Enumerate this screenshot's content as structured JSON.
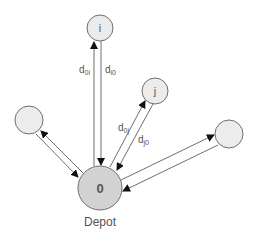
{
  "diagram": {
    "title": "",
    "colors": {
      "node_fill": "#ececec",
      "depot_fill": "#d2d2d2",
      "stroke": "#6e6e6e",
      "text": "#555555"
    },
    "nodes": [
      {
        "id": "depot",
        "label": "0",
        "caption": "Depot",
        "cx": 100,
        "cy": 188,
        "r": 22
      },
      {
        "id": "i",
        "label": "i",
        "cx": 100,
        "cy": 28,
        "r": 13
      },
      {
        "id": "j",
        "label": "j",
        "cx": 155,
        "cy": 91,
        "r": 13
      },
      {
        "id": "left",
        "label": "",
        "cx": 29,
        "cy": 120,
        "r": 14
      },
      {
        "id": "right",
        "label": "",
        "cx": 229,
        "cy": 134,
        "r": 14
      }
    ],
    "edges": [
      {
        "from": "depot",
        "to": "i",
        "label_main": "d",
        "label_sub": "0i"
      },
      {
        "from": "i",
        "to": "depot",
        "label_main": "d",
        "label_sub": "i0"
      },
      {
        "from": "depot",
        "to": "j",
        "label_main": "d",
        "label_sub": "0j"
      },
      {
        "from": "j",
        "to": "depot",
        "label_main": "d",
        "label_sub": "j0"
      },
      {
        "from": "depot",
        "to": "left",
        "label_main": "",
        "label_sub": ""
      },
      {
        "from": "left",
        "to": "depot",
        "label_main": "",
        "label_sub": ""
      },
      {
        "from": "depot",
        "to": "right",
        "label_main": "",
        "label_sub": ""
      },
      {
        "from": "right",
        "to": "depot",
        "label_main": "",
        "label_sub": ""
      }
    ]
  }
}
